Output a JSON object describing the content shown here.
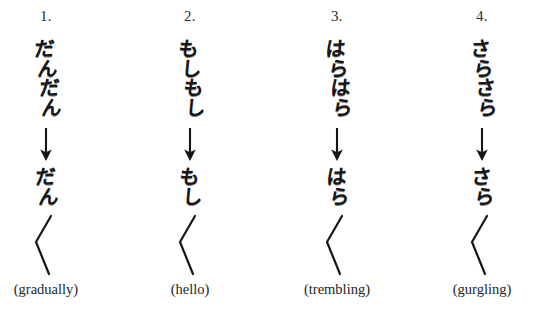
{
  "figure": {
    "background_color": "#ffffff",
    "ink_color": "#161616",
    "columns": [
      {
        "number": "1.",
        "full_form": [
          "だ",
          "ん",
          "だ",
          "ん"
        ],
        "full_form_text": "だんだん",
        "short_form": [
          "だ",
          "ん"
        ],
        "short_form_text": "だん",
        "iteration_mark": "〱",
        "arrow": "↓",
        "gloss": "(gradually)"
      },
      {
        "number": "2.",
        "full_form": [
          "も",
          "し",
          "も",
          "し"
        ],
        "full_form_text": "もしもし",
        "short_form": [
          "も",
          "し"
        ],
        "short_form_text": "もし",
        "iteration_mark": "〱",
        "arrow": "↓",
        "gloss": "(hello)"
      },
      {
        "number": "3.",
        "full_form": [
          "は",
          "ら",
          "は",
          "ら"
        ],
        "full_form_text": "はらはら",
        "short_form": [
          "は",
          "ら"
        ],
        "short_form_text": "はら",
        "iteration_mark": "〱",
        "arrow": "↓",
        "gloss": "(trembling)"
      },
      {
        "number": "4.",
        "full_form": [
          "さ",
          "ら",
          "さ",
          "ら"
        ],
        "full_form_text": "さらさら",
        "short_form": [
          "さ",
          "ら"
        ],
        "short_form_text": "さら",
        "iteration_mark": "〱",
        "arrow": "↓",
        "gloss": "(gurgling)"
      }
    ]
  }
}
